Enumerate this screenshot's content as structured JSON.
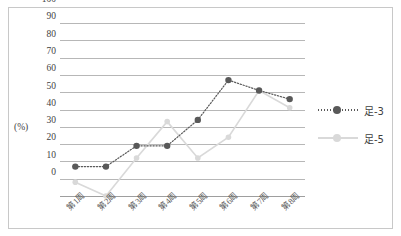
{
  "chart_data": {
    "type": "line",
    "title": "",
    "xlabel": "",
    "ylabel": "(%)",
    "ylim": [
      0,
      100
    ],
    "ytick_step": 10,
    "yticks": [
      100,
      90,
      80,
      70,
      60,
      50,
      40,
      30,
      20,
      10,
      0
    ],
    "grid": "horizontal",
    "legend_position": "right",
    "categories": [
      "第1周",
      "第2周",
      "第3周",
      "第4周",
      "第5周",
      "第6周",
      "第7周",
      "第8周"
    ],
    "series": [
      {
        "name": "足-3",
        "color": "#595959",
        "line_style": "dotted",
        "marker": "filled-circle",
        "values": [
          17,
          17,
          29,
          29,
          44,
          67,
          61,
          56
        ]
      },
      {
        "name": "足-5",
        "color": "#d9d9d9",
        "line_style": "solid",
        "marker": "filled-circle",
        "values": [
          8,
          0,
          22,
          43,
          22,
          34,
          61,
          51
        ]
      }
    ]
  },
  "legend": {
    "items": [
      {
        "label": "足-3"
      },
      {
        "label": "足-5"
      }
    ]
  },
  "colors": {
    "series_dark": "#595959",
    "series_light": "#d9d9d9",
    "gridline": "#b7b7b7",
    "border": "#c8c8c8",
    "text": "#3f3f3f",
    "background": "#ffffff"
  }
}
